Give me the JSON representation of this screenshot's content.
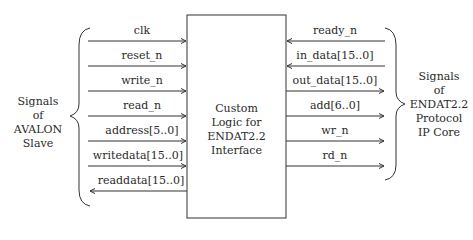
{
  "left_group": {
    "title_lines": [
      "Signals",
      "of",
      "AVALON",
      "Slave"
    ]
  },
  "right_group": {
    "title_lines": [
      "Signals",
      "of",
      "ENDAT2.2",
      "Protocol",
      "IP Core"
    ]
  },
  "center_block": {
    "lines": [
      "Custom",
      "Logic for",
      "ENDAT2.2",
      "Interface"
    ]
  },
  "left_signals": [
    {
      "label": "clk",
      "direction": "in"
    },
    {
      "label": "reset_n",
      "direction": "in"
    },
    {
      "label": "write_n",
      "direction": "in"
    },
    {
      "label": "read_n",
      "direction": "in"
    },
    {
      "label": "address[5..0]",
      "direction": "in"
    },
    {
      "label": "writedata[15..0]",
      "direction": "in"
    },
    {
      "label": "readdata[15..0]",
      "direction": "out"
    }
  ],
  "right_signals": [
    {
      "label": "ready_n",
      "direction": "in"
    },
    {
      "label": "in_data[15..0]",
      "direction": "in"
    },
    {
      "label": "out_data[15..0]",
      "direction": "out"
    },
    {
      "label": "add[6..0]",
      "direction": "out"
    },
    {
      "label": "wr_n",
      "direction": "out"
    },
    {
      "label": "rd_n",
      "direction": "out"
    }
  ],
  "colors": {
    "line": "#333333",
    "text": "#2a2a2a",
    "background": "#ffffff"
  }
}
